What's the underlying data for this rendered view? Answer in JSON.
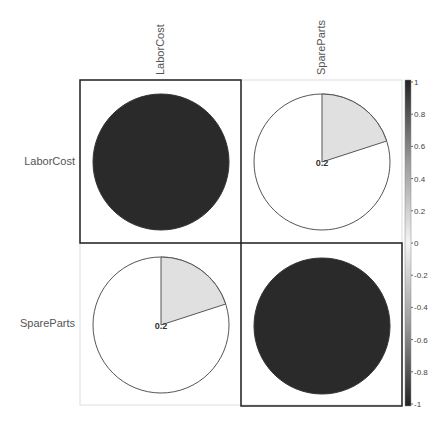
{
  "chart_data": {
    "type": "heatmap",
    "subtype": "correlation-pie-matrix",
    "variables": [
      "LaborCost",
      "SpareParts"
    ],
    "matrix": [
      [
        1,
        0.2
      ],
      [
        0.2,
        1
      ]
    ],
    "cell_labels": [
      [
        "",
        "0.2"
      ],
      [
        "0.2",
        ""
      ]
    ],
    "colorbar": {
      "range": [
        -1,
        1
      ],
      "ticks": [
        "1",
        "0.8",
        "0.6",
        "0.4",
        "0.2",
        "0",
        "-0.2",
        "-0.4",
        "-0.6",
        "-0.8",
        "-1"
      ]
    },
    "highlighted_cells": [
      [
        0,
        0
      ],
      [
        1,
        1
      ]
    ],
    "title": "",
    "xlabel": "",
    "ylabel": ""
  },
  "labels": {
    "col": [
      "LaborCost",
      "SpareParts"
    ],
    "row": [
      "LaborCost",
      "SpareParts"
    ]
  },
  "colors": {
    "full_pie": "#2a2a2a",
    "partial_slice": "#e0e0e0",
    "outline": "#555555"
  }
}
